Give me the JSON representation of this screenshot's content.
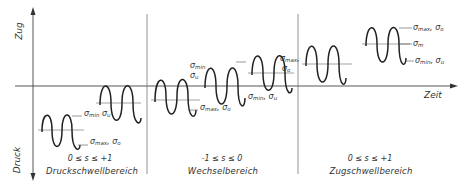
{
  "axes": {
    "y_positive": "Zug",
    "y_negative": "Druck",
    "x": "Zeit"
  },
  "regions": [
    {
      "range": "0 ≤ s ≤ +1",
      "name": "Druckschwellbereich"
    },
    {
      "range": "-1 ≤ s ≤ 0",
      "name": "Wechselbereich"
    },
    {
      "range": "0 ≤ s ≤ +1",
      "name": "Zugschwellbereich"
    }
  ],
  "labels": {
    "druck_1_top": {
      "a": "σ",
      "a_sub": "min",
      "b": "σ",
      "b_sub": "u"
    },
    "druck_1_bottom": {
      "a": "σ",
      "a_sub": "max",
      "b": "σ",
      "b_sub": "o"
    },
    "wechsel_1_top": {
      "a": "σ",
      "a_sub": "min",
      "b": "σ",
      "b_sub": "u"
    },
    "wechsel_1_bottom": {
      "a": "σ",
      "a_sub": "max",
      "b": "σ",
      "b_sub": "o"
    },
    "wechsel_2_top": {
      "a": "σ",
      "a_sub": "max",
      "b": "σ",
      "b_sub": "o"
    },
    "wechsel_2_bottom": {
      "a": "σ",
      "a_sub": "min",
      "b": "σ",
      "b_sub": "u"
    },
    "zug_top": {
      "a": "σ",
      "a_sub": "max",
      "b": "σ",
      "b_sub": "o"
    },
    "zug_mid": {
      "a": "σ",
      "a_sub": "m"
    },
    "zug_bottom": {
      "a": "σ",
      "a_sub": "min",
      "b": "σ",
      "b_sub": "u"
    }
  },
  "colors": {
    "line": "#333333",
    "thin": "#555555"
  }
}
